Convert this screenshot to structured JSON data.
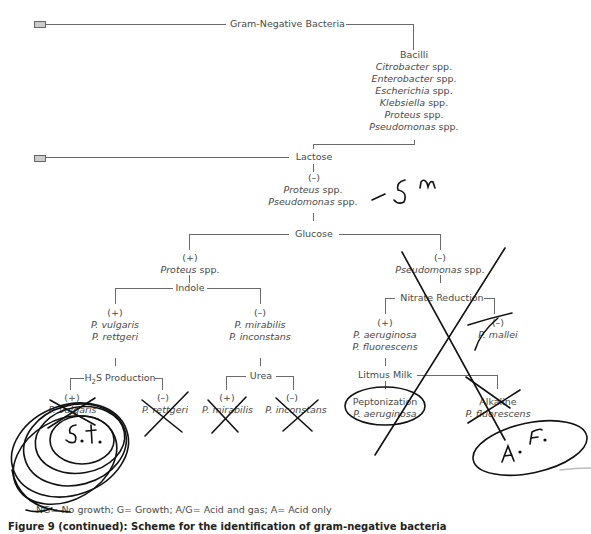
{
  "diagram": {
    "root": "Gram-Negative Bacteria",
    "bacilli": {
      "heading": "Bacilli",
      "genera": [
        {
          "name": "Citrobacter",
          "suffix": " spp."
        },
        {
          "name": "Enterobacter",
          "suffix": " spp."
        },
        {
          "name": "Escherichia",
          "suffix": " spp."
        },
        {
          "name": "Klebsiella",
          "suffix": " spp."
        },
        {
          "name": "Proteus",
          "suffix": " spp."
        },
        {
          "name": "Pseudomonas",
          "suffix": " spp."
        }
      ]
    },
    "lactose": {
      "test": "Lactose",
      "result": "(–)",
      "organisms": [
        {
          "name": "Proteus",
          "suffix": " spp."
        },
        {
          "name": "Pseudomonas",
          "suffix": " spp."
        }
      ]
    },
    "glucose": {
      "test": "Glucose",
      "positive": {
        "result": "(+)",
        "name": "Proteus",
        "suffix": " spp."
      },
      "negative": {
        "result": "(–)",
        "name": "Pseudomonas",
        "suffix": " spp."
      }
    },
    "indole": {
      "test": "Indole",
      "positive": {
        "result": "(+)",
        "organisms": [
          "P. vulgaris",
          "P. rettgeri"
        ]
      },
      "negative": {
        "result": "(–)",
        "organisms": [
          "P. mirabilis",
          "P. inconstans"
        ]
      }
    },
    "h2s": {
      "test_prefix": "H",
      "test_sub": "2",
      "test_suffix": "S Production",
      "positive": {
        "result": "(+)",
        "organism": "P. vulgaris"
      },
      "negative": {
        "result": "(–)",
        "organism": "P. rettgeri"
      }
    },
    "urea": {
      "test": "Urea",
      "positive": {
        "result": "(+)",
        "organism": "P. mirabilis"
      },
      "negative": {
        "result": "(–)",
        "organism": "P. inconstans"
      }
    },
    "nitrate": {
      "test": "Nitrate Reduction",
      "positive": {
        "result": "(+)",
        "organisms": [
          "P. aeruginosa",
          "P. fluorescens"
        ]
      },
      "negative": {
        "result": "(–)",
        "organism": "P. mallei"
      }
    },
    "litmus": {
      "test": "Litmus Milk",
      "peptonization": {
        "label": "Peptonization",
        "organism": "P. aeruginosa"
      },
      "alkaline": {
        "label": "Alkaline",
        "organism": "P. fluorescens"
      }
    },
    "annotations": {
      "sm": "– S m",
      "st": "S.t.",
      "af": "A. F."
    },
    "legend": "NG= No growth;  G= Growth;  A/G= Acid and gas;  A= Acid only",
    "caption": "Figure 9 (continued): Scheme for the identification of gram-negative bacteria"
  }
}
